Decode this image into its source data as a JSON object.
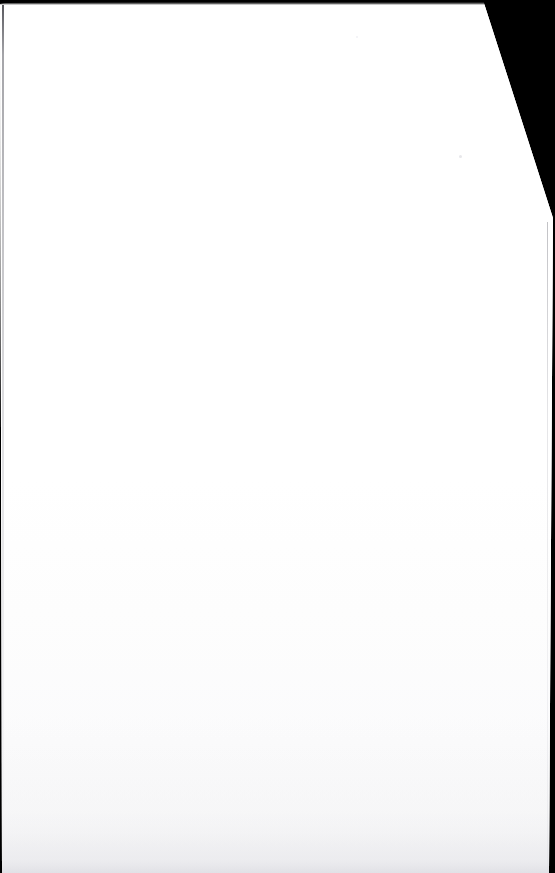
{
  "document": {
    "kind": "scanned-page",
    "title": "Scanned blank page",
    "page_text": "",
    "is_blank": true,
    "orientation": "portrait",
    "page_color": "#ffffff",
    "backdrop_color": "#000000"
  },
  "scan": {
    "viewport_width": 555,
    "viewport_height": 873,
    "description": "Blank white sheet photographed/scanned against a solid black background; the top-right corner of the sheet is cut away on a diagonal.",
    "background_label": "scanner-backdrop",
    "sheet_label": "page-sheet"
  },
  "artifacts": {
    "top_band_label": "top-shadow-band",
    "top_band_color": "#000000",
    "left_edge_label": "left-edge-line",
    "left_edge_color": "#3c3c42",
    "right_edge_label": "right-edge-line",
    "right_edge_color": "#9a9aa2",
    "bottom_fade_label": "bottom-fade",
    "bottom_fade_color": "#e2e2e7",
    "corner_cut_label": "corner-cut-edge",
    "speck_label": "dust-speck"
  },
  "geometry": {
    "corner_cut_start_x": 483,
    "corner_cut_start_y": 0,
    "corner_cut_end_x": 553,
    "corner_cut_end_y": 218,
    "left_margin_x": 2,
    "right_margin_x": 549,
    "top_margin_y": 4
  }
}
